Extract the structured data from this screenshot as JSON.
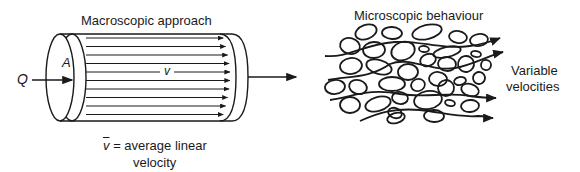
{
  "macroscopic": {
    "title": "Macroscopic approach",
    "flow_symbol": "Q",
    "area_symbol": "A",
    "velocity_symbol": "v",
    "legend_symbol": "v",
    "legend_text": "= average linear",
    "legend_text_line2": "velocity"
  },
  "microscopic": {
    "title": "Microscopic behaviour",
    "side_label_line1": "Variable",
    "side_label_line2": "velocities"
  },
  "colors": {
    "ink": "#1a1a1a",
    "background": "#ffffff"
  }
}
